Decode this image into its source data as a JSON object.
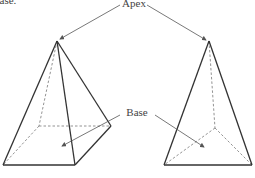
{
  "caption_fragment": "base.",
  "labels": {
    "apex": "Apex",
    "base": "Base"
  },
  "figures": [
    {
      "name": "square-pyramid",
      "description": "Pyramid with square base"
    },
    {
      "name": "triangular-pyramid",
      "description": "Pyramid with triangular base"
    }
  ]
}
